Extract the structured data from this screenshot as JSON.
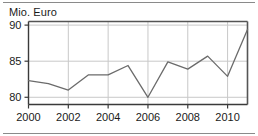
{
  "figure": {
    "axis_title": "Mio. Euro"
  },
  "chart_data": {
    "type": "line",
    "title": "",
    "subtitle": "",
    "xlabel": "",
    "ylabel": "Mio. Euro",
    "x": [
      2000,
      2001,
      2002,
      2003,
      2004,
      2005,
      2006,
      2007,
      2008,
      2009,
      2010,
      2011
    ],
    "values": [
      82.3,
      81.9,
      81.0,
      83.1,
      83.1,
      84.4,
      80.0,
      84.9,
      83.9,
      85.7,
      82.9,
      89.4
    ],
    "series": [
      {
        "name": "Mio. Euro",
        "values": [
          82.3,
          81.9,
          81.0,
          83.1,
          83.1,
          84.4,
          80.0,
          84.9,
          83.9,
          85.7,
          82.9,
          89.4
        ]
      }
    ],
    "xlim": [
      2000,
      2011
    ],
    "ylim": [
      79.0,
      90.5
    ],
    "ytick_labels": [
      "80",
      "85",
      "90"
    ],
    "ytick_values": [
      80,
      85,
      90
    ],
    "xtick_labels": [
      "2000",
      "2002",
      "2004",
      "2006",
      "2008",
      "2010"
    ],
    "xtick_values": [
      2000,
      2002,
      2004,
      2006,
      2008,
      2010
    ],
    "grid": true,
    "grid_axis": "both",
    "legend": false,
    "legend_position": "none",
    "line_color": "#6b6b6b",
    "grid_color": "#c8c8c8",
    "frame_color": "#555555",
    "text_color": "#1a1a1a",
    "background": "#ffffff"
  }
}
